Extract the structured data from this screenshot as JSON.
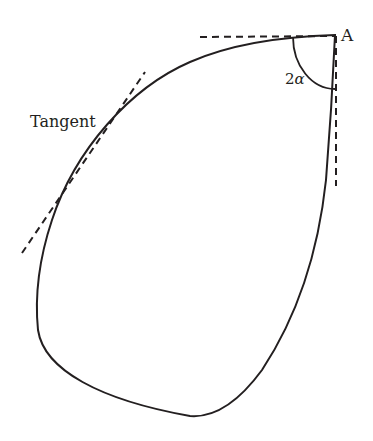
{
  "diagram": {
    "type": "geometric-figure",
    "colors": {
      "stroke": "#231f20",
      "background": "#ffffff"
    },
    "labels": {
      "point": "A",
      "angle_coefficient": "2",
      "angle_symbol": "α",
      "tangent": "Tangent"
    },
    "elements": [
      {
        "id": "closed-curve",
        "kind": "curve",
        "style": "solid"
      },
      {
        "id": "horizontal-tangent-at-A",
        "kind": "line",
        "style": "dashed"
      },
      {
        "id": "vertical-tangent-at-A",
        "kind": "line",
        "style": "dashed"
      },
      {
        "id": "angle-arc-2alpha",
        "kind": "arc",
        "style": "solid"
      },
      {
        "id": "left-tangent-line",
        "kind": "line",
        "style": "dashed"
      }
    ]
  }
}
